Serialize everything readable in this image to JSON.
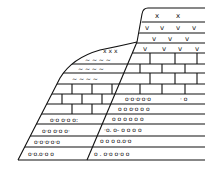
{
  "diagram": {
    "type": "geological-cross-section",
    "colors": {
      "line": "#111111",
      "background": "#ffffff"
    },
    "layers": [
      {
        "name": "conglomerate",
        "symbol": "o . o"
      },
      {
        "name": "limestone",
        "symbol": "brick"
      },
      {
        "name": "tuff",
        "symbol": "v"
      },
      {
        "name": "igneous",
        "symbol": "x"
      }
    ]
  }
}
